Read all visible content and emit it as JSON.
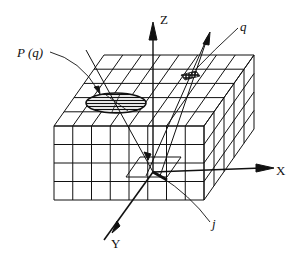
{
  "diagram": {
    "labels": {
      "z_axis": "Z",
      "x_axis": "X",
      "y_axis": "Y",
      "projection": "P (q)",
      "point": "q",
      "ray": "j"
    },
    "grid": {
      "front_columns": 8,
      "front_rows": 4,
      "depth_cells": 5
    },
    "colors": {
      "line": "#111111",
      "background": "#ffffff"
    }
  }
}
